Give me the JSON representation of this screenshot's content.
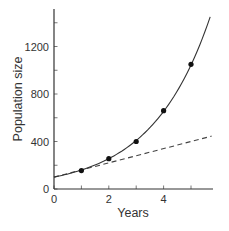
{
  "chart_data": {
    "type": "line",
    "title": "",
    "xlabel": "Years",
    "ylabel": "Population size",
    "xlim": [
      0,
      5.75
    ],
    "ylim": [
      0,
      1500
    ],
    "x_ticks": [
      0,
      1,
      2,
      3,
      4,
      5
    ],
    "x_tick_labels": [
      "0",
      "2",
      "4"
    ],
    "x_tick_labels_at": [
      0,
      2,
      4
    ],
    "y_ticks": [
      0,
      200,
      400,
      600,
      800,
      1000,
      1200,
      1400
    ],
    "y_tick_labels": [
      "0",
      "400",
      "800",
      "1200"
    ],
    "y_tick_labels_at": [
      0,
      400,
      800,
      1200
    ],
    "grid": false,
    "legend": null,
    "series": [
      {
        "name": "Exponential growth (observed)",
        "style": "solid",
        "markers": true,
        "x": [
          1,
          2,
          3,
          4,
          5
        ],
        "values": [
          155,
          255,
          400,
          660,
          1050
        ]
      },
      {
        "name": "Exponential curve fit",
        "style": "solid",
        "markers": false,
        "x": [
          0,
          1,
          2,
          3,
          4,
          5,
          5.7
        ],
        "values": [
          100,
          150,
          245,
          395,
          650,
          1050,
          1450
        ]
      },
      {
        "name": "Linear growth",
        "style": "dashed",
        "markers": false,
        "x": [
          0,
          5.75
        ],
        "values": [
          100,
          445
        ]
      }
    ]
  }
}
